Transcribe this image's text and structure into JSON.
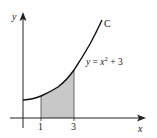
{
  "diagram": {
    "curve_name": "C",
    "equation": {
      "lhs": "y",
      "eq": " = ",
      "var": "x",
      "exponent": "2",
      "rest": " + 3"
    },
    "axes": {
      "x_label": "x",
      "y_label": "y"
    },
    "ticks": [
      {
        "label": "1",
        "x_value": 1
      },
      {
        "label": "3",
        "x_value": 3
      }
    ],
    "shaded_region": {
      "from": 1,
      "to": 3,
      "color": "#c8c8c8"
    },
    "colors": {
      "axis": "#222222",
      "curve": "#111111",
      "shade": "#c8c8c8"
    }
  }
}
